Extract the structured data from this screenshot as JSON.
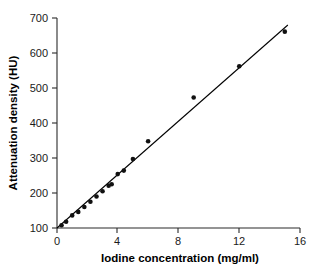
{
  "chart_data": {
    "type": "scatter",
    "title": "",
    "xlabel": "Iodine concentration (mg/ml)",
    "ylabel": "Attenuation density (HU)",
    "xlim": [
      0,
      16
    ],
    "ylim": [
      100,
      700
    ],
    "xticks": [
      "0",
      "4",
      "8",
      "12",
      "16"
    ],
    "xtick_values": [
      0,
      4,
      8,
      12,
      16
    ],
    "yticks": [
      "100",
      "200",
      "300",
      "400",
      "500",
      "600",
      "700"
    ],
    "ytick_values": [
      100,
      200,
      300,
      400,
      500,
      600,
      700
    ],
    "grid": false,
    "legend": false,
    "series": [
      {
        "name": "Measured attenuation",
        "marker": "filled-circle",
        "color": "#111111",
        "x": [
          0.3,
          0.6,
          1.0,
          1.4,
          1.8,
          2.2,
          2.6,
          3.0,
          3.4,
          3.6,
          4.0,
          4.4,
          5.0,
          6.0,
          9.0,
          12.0,
          15.0
        ],
        "y": [
          108,
          118,
          136,
          146,
          160,
          175,
          190,
          205,
          221,
          225,
          254,
          264,
          297,
          348,
          473,
          562,
          661
        ]
      }
    ],
    "fit_line": {
      "name": "Linear regression fit",
      "color": "#000000",
      "x": [
        0.0,
        15.2
      ],
      "y": [
        100,
        680
      ]
    },
    "annotations": []
  }
}
